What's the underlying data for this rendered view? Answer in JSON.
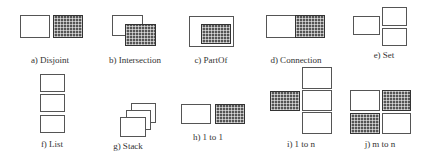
{
  "figure": {
    "panels": [
      {
        "id": "a",
        "label": "a) Disjoint"
      },
      {
        "id": "b",
        "label": "b) Intersection"
      },
      {
        "id": "c",
        "label": "c) PartOf"
      },
      {
        "id": "d",
        "label": "d) Connection"
      },
      {
        "id": "e",
        "label": "e) Set"
      },
      {
        "id": "f",
        "label": "f) List"
      },
      {
        "id": "g",
        "label": "g) Stack"
      },
      {
        "id": "h",
        "label": "h) 1 to 1"
      },
      {
        "id": "i",
        "label": "i) 1 to n"
      },
      {
        "id": "j",
        "label": "j) m to n"
      }
    ]
  },
  "colors": {
    "outline": "#555555",
    "hatch_fill": "#555555",
    "background": "#ffffff"
  }
}
